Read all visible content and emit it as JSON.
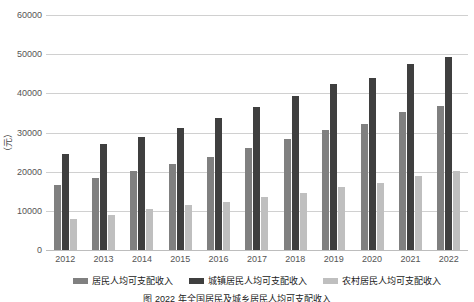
{
  "chart_data": {
    "type": "bar",
    "title": "",
    "xlabel": "",
    "ylabel": "（元）",
    "ylim": [
      0,
      60000
    ],
    "ytick_labels": [
      "60000",
      "50000",
      "40000",
      "30000",
      "20000",
      "10000",
      "0"
    ],
    "ytick_values": [
      60000,
      50000,
      40000,
      30000,
      20000,
      10000,
      0
    ],
    "grid": true,
    "legend_position": "bottom",
    "categories": [
      "2012",
      "2013",
      "2014",
      "2015",
      "2016",
      "2017",
      "2018",
      "2019",
      "2020",
      "2021",
      "2022"
    ],
    "series": [
      {
        "name": "居民人均可支配收入",
        "color": "#808080",
        "values": [
          16500,
          18300,
          20200,
          21966,
          23821,
          25974,
          28228,
          30733,
          32189,
          35128,
          36883
        ]
      },
      {
        "name": "城镇居民人均可支配收入",
        "color": "#3f3f3f",
        "values": [
          24565,
          26955,
          28844,
          31195,
          33616,
          36396,
          39251,
          42359,
          43834,
          47412,
          49283
        ]
      },
      {
        "name": "农村居民人均可支配收入",
        "color": "#bfbfbf",
        "values": [
          7917,
          8896,
          10489,
          11422,
          12363,
          13432,
          14617,
          16021,
          17131,
          18931,
          20133
        ]
      }
    ]
  },
  "axis": {
    "y_title": "（元）"
  },
  "legend": {
    "items": [
      {
        "label": "居民人均可支配收入",
        "color": "#808080"
      },
      {
        "label": "城镇居民人均可支配收入",
        "color": "#3f3f3f"
      },
      {
        "label": "农村居民人均可支配收入",
        "color": "#bfbfbf"
      }
    ]
  },
  "caption": {
    "text": "图      2022 年全国居民及城乡居民人均可支配收入"
  }
}
